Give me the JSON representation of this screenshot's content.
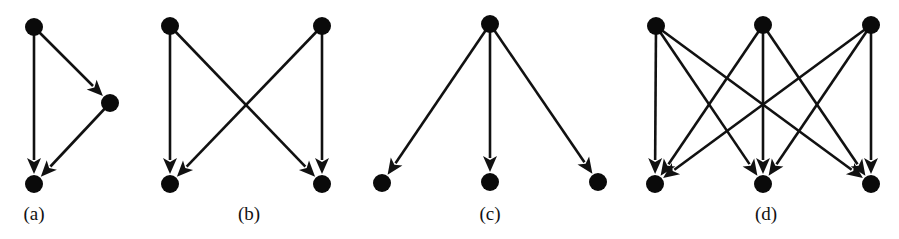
{
  "figure": {
    "width": 899,
    "height": 239,
    "background": "#ffffff",
    "stroke_color": "#111111",
    "node_color": "#0a0a0a",
    "node_radius": 9,
    "edge_width": 2.6
  },
  "graphs": [
    {
      "id": "a",
      "label": "(a)",
      "label_pos": [
        34,
        204
      ],
      "nodes": [
        {
          "id": "a1",
          "x": 34,
          "y": 27
        },
        {
          "id": "a2",
          "x": 110,
          "y": 103
        },
        {
          "id": "a3",
          "x": 34,
          "y": 184
        }
      ],
      "edges": [
        {
          "from": "a1",
          "to": "a2"
        },
        {
          "from": "a1",
          "to": "a3"
        },
        {
          "from": "a2",
          "to": "a3"
        }
      ]
    },
    {
      "id": "b",
      "label": "(b)",
      "label_pos": [
        249,
        204
      ],
      "nodes": [
        {
          "id": "b1",
          "x": 170,
          "y": 26
        },
        {
          "id": "b2",
          "x": 322,
          "y": 26
        },
        {
          "id": "b3",
          "x": 170,
          "y": 184
        },
        {
          "id": "b4",
          "x": 322,
          "y": 184
        }
      ],
      "edges": [
        {
          "from": "b1",
          "to": "b3"
        },
        {
          "from": "b1",
          "to": "b4"
        },
        {
          "from": "b2",
          "to": "b3"
        },
        {
          "from": "b2",
          "to": "b4"
        }
      ]
    },
    {
      "id": "c",
      "label": "(c)",
      "label_pos": [
        490,
        204
      ],
      "nodes": [
        {
          "id": "c1",
          "x": 490,
          "y": 24
        },
        {
          "id": "c2",
          "x": 382,
          "y": 183
        },
        {
          "id": "c3",
          "x": 490,
          "y": 182
        },
        {
          "id": "c4",
          "x": 598,
          "y": 182
        }
      ],
      "edges": [
        {
          "from": "c1",
          "to": "c2"
        },
        {
          "from": "c1",
          "to": "c3"
        },
        {
          "from": "c1",
          "to": "c4"
        }
      ]
    },
    {
      "id": "d",
      "label": "(d)",
      "label_pos": [
        766,
        204
      ],
      "nodes": [
        {
          "id": "d1",
          "x": 656,
          "y": 26
        },
        {
          "id": "d2",
          "x": 763,
          "y": 25
        },
        {
          "id": "d3",
          "x": 871,
          "y": 25
        },
        {
          "id": "d4",
          "x": 655,
          "y": 184
        },
        {
          "id": "d5",
          "x": 763,
          "y": 184
        },
        {
          "id": "d6",
          "x": 871,
          "y": 184
        }
      ],
      "edges": [
        {
          "from": "d1",
          "to": "d4"
        },
        {
          "from": "d1",
          "to": "d5"
        },
        {
          "from": "d1",
          "to": "d6"
        },
        {
          "from": "d2",
          "to": "d4"
        },
        {
          "from": "d2",
          "to": "d5"
        },
        {
          "from": "d2",
          "to": "d6"
        },
        {
          "from": "d3",
          "to": "d4"
        },
        {
          "from": "d3",
          "to": "d5"
        },
        {
          "from": "d3",
          "to": "d6"
        }
      ]
    }
  ]
}
